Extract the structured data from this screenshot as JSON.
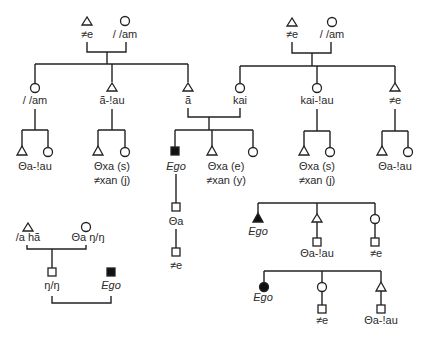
{
  "diagram": {
    "legend": {
      "triangle": "male",
      "circle": "female",
      "square": "person (either sex)",
      "filled": "Ego"
    },
    "left_family": {
      "father": {
        "symbol": "triangle",
        "name": "≠e"
      },
      "mother": {
        "symbol": "circle",
        "name": "/ /am"
      },
      "children": [
        {
          "symbol": "circle",
          "name": "/ /am",
          "children_label": "Θa-!au"
        },
        {
          "symbol": "triangle",
          "name": "ã-!au",
          "children_label_1": "Θxa (s)",
          "children_label_2": "≠xan (j)"
        },
        {
          "symbol": "triangle",
          "name": "ã"
        }
      ]
    },
    "right_family": {
      "father": {
        "symbol": "triangle",
        "name": "≠e"
      },
      "mother": {
        "symbol": "circle",
        "name": "/ /am"
      },
      "children": [
        {
          "symbol": "circle",
          "name": "kai"
        },
        {
          "symbol": "circle",
          "name": "kai-!au",
          "children_label_1": "Θxa (s)",
          "children_label_2": "≠xan (j)"
        },
        {
          "symbol": "triangle",
          "name": "≠e",
          "children_label": "Θa-!au"
        }
      ]
    },
    "center_family": {
      "ego": {
        "symbol": "filled-square",
        "name": "Ego"
      },
      "sibling_label_1": "Θxa (e)",
      "sibling_label_2": "≠xan (y)",
      "ego_child": "Θa",
      "ego_grandchild": "≠e"
    },
    "bottom_left": {
      "father": {
        "symbol": "triangle",
        "name": "/a hã"
      },
      "mother": {
        "symbol": "circle",
        "name": "Θa ŋ/ŋ"
      },
      "child": {
        "symbol": "square",
        "name": "ŋ/ŋ"
      },
      "ego": {
        "symbol": "filled-square",
        "name": "Ego"
      }
    },
    "bottom_right_male": {
      "ego": {
        "symbol": "filled-triangle",
        "name": "Ego"
      },
      "sibling_1": {
        "symbol": "triangle",
        "child": "Θa-!au"
      },
      "sibling_2": {
        "symbol": "circle",
        "child": "≠e"
      }
    },
    "bottom_right_female": {
      "ego": {
        "symbol": "filled-circle",
        "name": "Ego"
      },
      "sibling_1": {
        "symbol": "circle",
        "child": "≠e"
      },
      "sibling_2": {
        "symbol": "triangle",
        "child": "Θa-!au"
      }
    }
  }
}
